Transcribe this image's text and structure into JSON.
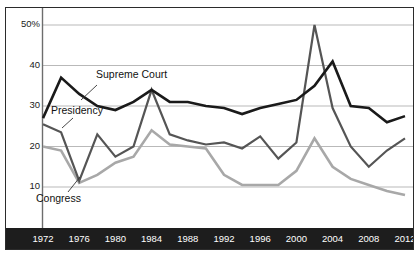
{
  "chart_data": {
    "type": "line",
    "title": "",
    "subtitle": "",
    "xlabel": "",
    "ylabel": "",
    "xlim": [
      1972,
      2012
    ],
    "ylim": [
      0,
      53
    ],
    "grid": true,
    "grid_axis": "y",
    "legend_position": "inline-annotations",
    "y_ticks": [
      10,
      20,
      30,
      40,
      50
    ],
    "y_tick_labels": [
      "10",
      "20",
      "30",
      "40",
      "50%"
    ],
    "x_ticks": [
      1972,
      1976,
      1980,
      1984,
      1988,
      1992,
      1996,
      2000,
      2004,
      2008,
      2012
    ],
    "x_tick_labels": [
      "1972",
      "1976",
      "1980",
      "1984",
      "1988",
      "1992",
      "1996",
      "2000",
      "2004",
      "2008",
      "2012"
    ],
    "x": [
      1972,
      1974,
      1976,
      1978,
      1980,
      1982,
      1984,
      1986,
      1988,
      1990,
      1992,
      1994,
      1996,
      1998,
      2000,
      2002,
      2004,
      2006,
      2008,
      2010,
      2012
    ],
    "series": [
      {
        "name": "Supreme Court",
        "color": "#1a1a1a",
        "width": 2.6,
        "values": [
          27,
          37,
          33,
          30,
          29,
          31,
          34,
          31,
          31,
          30,
          29.5,
          28,
          29.5,
          30.5,
          31.5,
          35,
          41,
          30,
          29.5,
          26,
          27.5
        ]
      },
      {
        "name": "Presidency",
        "color": "#555555",
        "width": 2.2,
        "values": [
          25.5,
          23.5,
          11.5,
          23,
          17.5,
          20,
          34,
          23,
          21.5,
          20.5,
          21,
          19.5,
          22.5,
          17,
          21,
          50,
          29.5,
          20,
          15,
          19,
          22
        ]
      },
      {
        "name": "Congress",
        "color": "#a8a8a8",
        "width": 2.6,
        "values": [
          20,
          19,
          11,
          13,
          16,
          17.5,
          24,
          20.5,
          20,
          19.5,
          13,
          10.5,
          10.5,
          10.5,
          14,
          22,
          15,
          12,
          10.5,
          9,
          8
        ]
      }
    ],
    "annotations": [
      {
        "name": "supreme-court",
        "text": "Supreme Court",
        "x_px": 96,
        "y_px": 68,
        "leader": {
          "x1": 97,
          "y1": 85,
          "x2": 81,
          "y2": 100
        }
      },
      {
        "name": "presidency",
        "text": "Presidency",
        "x_px": 51,
        "y_px": 104,
        "leader": {
          "x1": 73,
          "y1": 118,
          "x2": 62,
          "y2": 128
        }
      },
      {
        "name": "congress",
        "text": "Congress",
        "x_px": 36,
        "y_px": 192,
        "leader": {
          "x1": 68,
          "y1": 192,
          "x2": 80,
          "y2": 177
        }
      }
    ]
  },
  "colors": {
    "frame": "#2b2b2b",
    "axis_band_bg": "#1d1d1d",
    "axis_band_text": "#ffffff",
    "gridline": "#b9b9b9",
    "axis_line": "#6d6d6d",
    "supreme_court": "#1a1a1a",
    "presidency": "#555555",
    "congress": "#a8a8a8",
    "background": "#ffffff",
    "tick_text": "#1a1a1a"
  }
}
